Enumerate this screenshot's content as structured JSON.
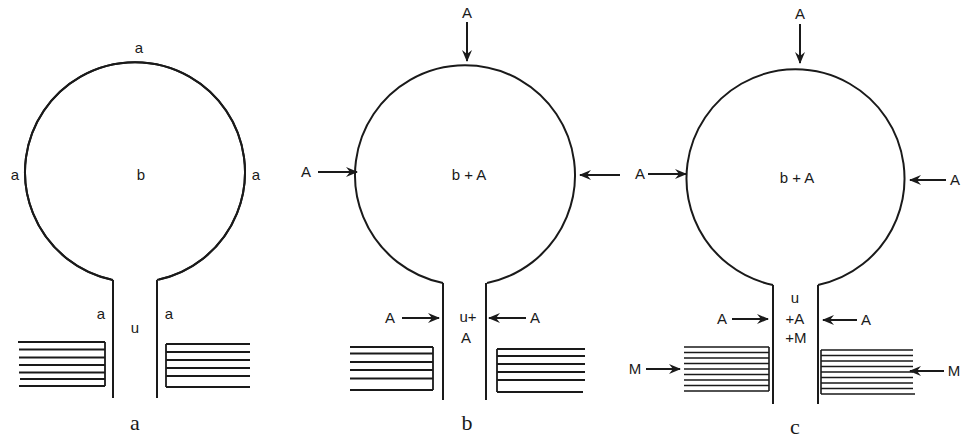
{
  "figure": {
    "panels": [
      {
        "id": "a",
        "caption": "a",
        "center_label": "b",
        "stalk_label": "u",
        "membrane_labels": {
          "top": "a",
          "left": "a",
          "right": "a",
          "stalk_left": "a",
          "stalk_right": "a"
        },
        "stack_lines": 6
      },
      {
        "id": "b",
        "caption": "b",
        "center_label": "b + A",
        "stalk_label_line1": "u+",
        "stalk_label_line2": "A",
        "arrows": {
          "top": "A",
          "left": "A",
          "right": "",
          "stalk_left": "A",
          "stalk_right": "A"
        },
        "stack_lines": 6
      },
      {
        "id": "c",
        "caption": "c",
        "center_label": "b + A",
        "stalk_label_line1": "u",
        "stalk_label_line2": "+A",
        "stalk_label_line3": "+M",
        "arrows": {
          "top": "A",
          "left": "A",
          "right": "A",
          "stalk_left": "A",
          "stalk_right": "A",
          "stack_left": "M",
          "stack_right": "M"
        },
        "stack_lines": 9
      }
    ],
    "colors": {
      "ink": "#1a1a1a",
      "background": "#ffffff"
    }
  }
}
